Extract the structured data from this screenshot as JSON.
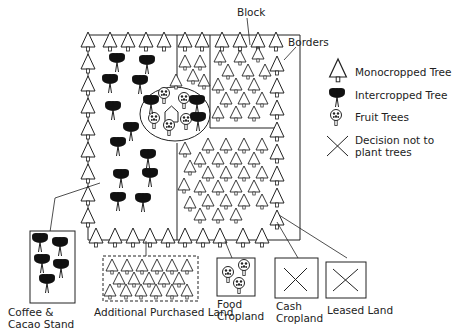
{
  "labels": {
    "block": "Block",
    "borders": "Borders",
    "coffee_cacao": "Coffee & Cacao Stand",
    "additional_land": "Additional Purchased Land",
    "food_cropland": "Food Cropland",
    "cash_cropland": "Cash Cropland",
    "leased_land": "Leased Land"
  },
  "legend": {
    "items": [
      {
        "icon": "monocropped-tree-icon",
        "label": "Monocropped Tree"
      },
      {
        "icon": "intercropped-tree-icon",
        "label": "Intercropped Tree"
      },
      {
        "icon": "fruit-tree-icon",
        "label": "Fruit Trees"
      },
      {
        "icon": "x-mark-icon",
        "label": "Decision not to plant trees"
      }
    ]
  },
  "colors": {
    "line": "#222222",
    "fill_dark": "#111111",
    "background": "#ffffff"
  }
}
